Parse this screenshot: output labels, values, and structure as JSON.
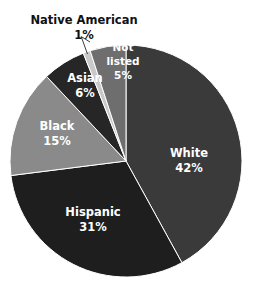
{
  "chart_data": {
    "type": "pie",
    "title": "",
    "subtitle": "",
    "xlabel": "",
    "ylabel": "",
    "legend_position": "none",
    "grid": false,
    "unit": "%",
    "start_angle_deg": 0,
    "direction": "clockwise",
    "categories": [
      "White",
      "Hispanic",
      "Black",
      "Asian",
      "Native American",
      "Not listed"
    ],
    "values": [
      42,
      31,
      15,
      6,
      1,
      5
    ],
    "labels": [
      {
        "name": "white",
        "category": "White",
        "value": 42,
        "label_line1": "White",
        "label_line2": "42%",
        "color": "#3a3a3a",
        "text_color": "#ffffff",
        "placement": "inside",
        "label_x": 189,
        "label_y": 159
      },
      {
        "name": "hispanic",
        "category": "Hispanic",
        "value": 31,
        "label_line1": "Hispanic",
        "label_line2": "31%",
        "color": "#1e1e1e",
        "text_color": "#ffffff",
        "placement": "inside",
        "label_x": 93,
        "label_y": 218
      },
      {
        "name": "black",
        "category": "Black",
        "value": 15,
        "label_line1": "Black",
        "label_line2": "15%",
        "color": "#8a8a8a",
        "text_color": "#ffffff",
        "placement": "inside",
        "label_x": 57,
        "label_y": 132
      },
      {
        "name": "asian",
        "category": "Asian",
        "value": 6,
        "label_line1": "Asian",
        "label_line2": "6%",
        "color": "#262626",
        "text_color": "#ffffff",
        "placement": "inside",
        "label_x": 85,
        "label_y": 84
      },
      {
        "name": "native-american",
        "category": "Native American",
        "value": 1,
        "label_line1": "Native American",
        "label_line2": "1%",
        "color": "#c9c9c9",
        "text_color": "#111111",
        "placement": "outside",
        "label_x": 84,
        "label_y": 20
      },
      {
        "name": "not-listed",
        "category": "Not listed",
        "value": 5,
        "label_line1": "Not",
        "label_line2": "listed",
        "label_line3": "5%",
        "color": "#6e6e6e",
        "text_color": "#ffffff",
        "placement": "inside",
        "label_x": 123,
        "label_y": 61
      }
    ],
    "geometry": {
      "center_x": 126,
      "center_y": 161,
      "radius": 116,
      "background": "#ffffff"
    }
  }
}
